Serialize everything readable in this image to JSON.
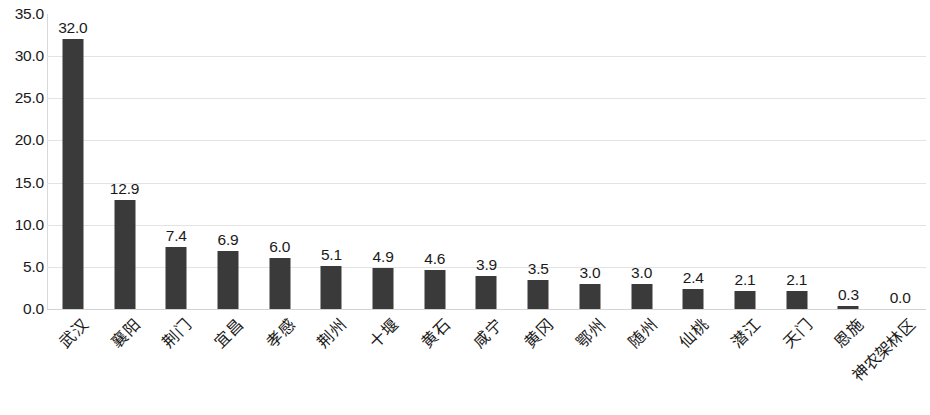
{
  "chart_data": {
    "type": "bar",
    "title": "",
    "subtitle": "",
    "xlabel": "",
    "ylabel": "",
    "ylim": [
      0.0,
      35.0
    ],
    "y_ticks": [
      "0.0",
      "5.0",
      "10.0",
      "15.0",
      "20.0",
      "25.0",
      "30.0",
      "35.0"
    ],
    "y_tick_values": [
      0.0,
      5.0,
      10.0,
      15.0,
      20.0,
      25.0,
      30.0,
      35.0
    ],
    "grid": true,
    "legend": false,
    "legend_position": "none",
    "bar_color": "#3a3a3a",
    "grid_color": "#e3e3e3",
    "axis_color": "#d9d9d9",
    "categories": [
      "武汉",
      "襄阳",
      "荆门",
      "宜昌",
      "孝感",
      "荆州",
      "十堰",
      "黄石",
      "咸宁",
      "黄冈",
      "鄂州",
      "随州",
      "仙桃",
      "潜江",
      "天门",
      "恩施",
      "神农架林区"
    ],
    "values": [
      32.0,
      12.9,
      7.4,
      6.9,
      6.0,
      5.1,
      4.9,
      4.6,
      3.9,
      3.5,
      3.0,
      3.0,
      2.4,
      2.1,
      2.1,
      0.3,
      0.0
    ],
    "data_labels": [
      "32.0",
      "12.9",
      "7.4",
      "6.9",
      "6.0",
      "5.1",
      "4.9",
      "4.6",
      "3.9",
      "3.5",
      "3.0",
      "3.0",
      "2.4",
      "2.1",
      "2.1",
      "0.3",
      "0.0"
    ]
  }
}
